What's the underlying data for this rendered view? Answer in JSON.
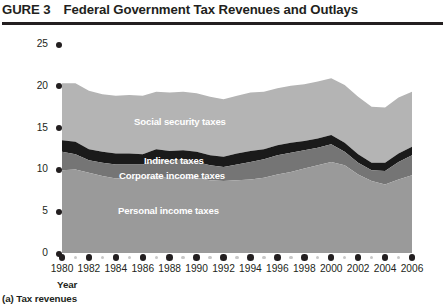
{
  "figure": {
    "number": "GURE 3",
    "title": "Federal Government Tax Revenues and Outlays",
    "panel_caption": "(a) Tax revenues"
  },
  "axes": {
    "y_title": "Tax revenues (percentage of GDP)",
    "x_title": "Year",
    "y_ticks": [
      "0",
      "5",
      "10",
      "15",
      "20",
      "25"
    ],
    "x_ticks": [
      "1980",
      "1982",
      "1984",
      "1986",
      "1988",
      "1990",
      "1992",
      "1994",
      "1996",
      "1998",
      "2000",
      "2002",
      "2004",
      "2006"
    ]
  },
  "series_labels": {
    "social": "Social security taxes",
    "indirect": "Indirect taxes",
    "corporate": "Corporate income taxes",
    "personal": "Personal income taxes"
  },
  "colors": {
    "social_security": "#b4b4b4",
    "indirect": "#1a1a1a",
    "corporate": "#757575",
    "personal": "#9a9a9a",
    "axis": "#231f20",
    "minor_tick": "#c8c8c8",
    "label_text": "#ffffff"
  },
  "chart_data": {
    "type": "area",
    "title": "Federal Government Tax Revenues and Outlays",
    "subtitle": "(a) Tax revenues",
    "xlabel": "Year",
    "ylabel": "Tax revenues (percentage of GDP)",
    "xlim": [
      1980,
      2006
    ],
    "ylim": [
      0,
      25
    ],
    "grid": false,
    "legend": "inline-labels",
    "stacked": true,
    "x": [
      1980,
      1981,
      1982,
      1983,
      1984,
      1985,
      1986,
      1987,
      1988,
      1989,
      1990,
      1991,
      1992,
      1993,
      1994,
      1995,
      1996,
      1997,
      1998,
      1999,
      2000,
      2001,
      2002,
      2003,
      2004,
      2005,
      2006
    ],
    "series": [
      {
        "name": "Personal income taxes",
        "values": [
          9.9,
          10.0,
          9.6,
          9.2,
          8.9,
          9.0,
          9.0,
          9.2,
          8.9,
          9.1,
          9.0,
          8.7,
          8.6,
          8.7,
          8.8,
          9.0,
          9.4,
          9.7,
          10.1,
          10.5,
          10.9,
          10.5,
          9.4,
          8.6,
          8.2,
          8.8,
          9.3
        ]
      },
      {
        "name": "Corporate income taxes",
        "values": [
          2.2,
          1.8,
          1.5,
          1.6,
          1.7,
          1.6,
          1.6,
          2.0,
          2.1,
          2.1,
          1.9,
          1.8,
          1.7,
          1.9,
          2.1,
          2.2,
          2.3,
          2.3,
          2.2,
          2.1,
          2.1,
          1.6,
          1.4,
          1.3,
          1.6,
          2.1,
          2.4
        ]
      },
      {
        "name": "Indirect taxes",
        "values": [
          1.4,
          1.5,
          1.3,
          1.3,
          1.3,
          1.3,
          1.2,
          1.2,
          1.2,
          1.1,
          1.2,
          1.2,
          1.2,
          1.3,
          1.3,
          1.2,
          1.2,
          1.2,
          1.1,
          1.1,
          1.1,
          1.1,
          1.0,
          0.9,
          1.0,
          1.0,
          1.0
        ]
      },
      {
        "name": "Social security taxes",
        "values": [
          6.8,
          7.0,
          7.0,
          6.9,
          6.9,
          7.0,
          7.0,
          6.9,
          7.0,
          7.0,
          7.0,
          7.0,
          6.9,
          6.9,
          7.0,
          6.9,
          6.8,
          6.8,
          6.8,
          6.8,
          6.8,
          6.9,
          6.9,
          6.7,
          6.6,
          6.7,
          6.6
        ]
      }
    ],
    "totals": [
      20.3,
      20.3,
      19.4,
      19.0,
      18.8,
      18.9,
      18.8,
      19.3,
      19.2,
      19.3,
      19.1,
      18.7,
      18.4,
      18.8,
      19.2,
      19.3,
      19.7,
      20.0,
      20.2,
      20.5,
      20.9,
      20.1,
      18.7,
      17.5,
      17.4,
      18.6,
      19.3
    ]
  }
}
